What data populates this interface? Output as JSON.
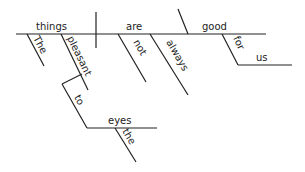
{
  "diagram": {
    "type": "sentence-diagram",
    "words": {
      "subject": "things",
      "verb": "are",
      "complement": "good",
      "subj_mod_1": "The",
      "subj_mod_2": "pleasant",
      "verb_mod_1": "not",
      "verb_mod_2": "always",
      "comp_prep": "for",
      "comp_obj": "us",
      "mod_prep": "to",
      "mod_obj": "eyes",
      "mod_obj_mod": "the"
    },
    "line_color": "#222222"
  }
}
